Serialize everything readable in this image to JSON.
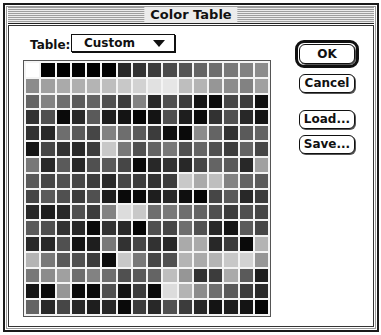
{
  "window": {
    "title": "Color Table"
  },
  "table_selector": {
    "label": "Table:",
    "value": "Custom"
  },
  "buttons": {
    "ok": "OK",
    "cancel": "Cancel",
    "load": "Load...",
    "save": "Save..."
  },
  "grid": {
    "rows": 16,
    "cols": 16,
    "gray_values": [
      [
        255,
        0,
        0,
        0,
        0,
        0,
        40,
        50,
        60,
        75,
        85,
        100,
        110,
        120,
        130,
        140
      ],
      [
        140,
        160,
        170,
        175,
        180,
        190,
        200,
        210,
        225,
        230,
        190,
        180,
        150,
        140,
        130,
        160
      ],
      [
        100,
        130,
        110,
        90,
        100,
        80,
        60,
        130,
        40,
        80,
        60,
        20,
        10,
        70,
        60,
        15
      ],
      [
        50,
        80,
        10,
        40,
        90,
        30,
        20,
        5,
        20,
        80,
        30,
        10,
        50,
        80,
        40,
        20
      ],
      [
        50,
        40,
        110,
        90,
        70,
        130,
        110,
        90,
        60,
        15,
        10,
        140,
        100,
        50,
        90,
        100
      ],
      [
        20,
        70,
        50,
        40,
        60,
        200,
        120,
        80,
        100,
        120,
        80,
        100,
        80,
        60,
        100,
        70
      ],
      [
        120,
        40,
        90,
        40,
        80,
        90,
        70,
        10,
        40,
        50,
        40,
        70,
        100,
        90,
        40,
        160
      ],
      [
        90,
        70,
        80,
        70,
        60,
        40,
        70,
        60,
        50,
        60,
        200,
        170,
        190,
        130,
        100,
        90
      ],
      [
        70,
        90,
        80,
        60,
        80,
        30,
        10,
        10,
        30,
        40,
        15,
        5,
        70,
        90,
        40,
        60
      ],
      [
        40,
        30,
        40,
        80,
        60,
        130,
        220,
        200,
        110,
        120,
        110,
        100,
        80,
        60,
        80,
        70
      ],
      [
        90,
        80,
        50,
        40,
        10,
        50,
        40,
        5,
        80,
        70,
        110,
        80,
        40,
        20,
        90,
        70
      ],
      [
        40,
        40,
        80,
        20,
        30,
        120,
        50,
        70,
        50,
        40,
        170,
        170,
        40,
        60,
        10,
        180
      ],
      [
        180,
        120,
        90,
        80,
        60,
        10,
        200,
        120,
        70,
        80,
        180,
        170,
        180,
        200,
        210,
        150
      ],
      [
        120,
        140,
        160,
        110,
        130,
        110,
        80,
        90,
        100,
        190,
        150,
        50,
        60,
        170,
        90,
        30
      ],
      [
        20,
        10,
        150,
        10,
        10,
        80,
        20,
        60,
        10,
        220,
        180,
        140,
        110,
        90,
        60,
        40
      ],
      [
        100,
        40,
        70,
        40,
        30,
        40,
        10,
        60,
        40,
        80,
        60,
        40,
        20,
        30,
        20,
        5
      ]
    ]
  }
}
